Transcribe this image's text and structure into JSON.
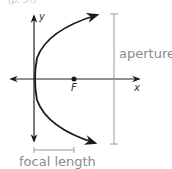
{
  "figure": {
    "top_fragment": "(p. 5?)",
    "axes": {
      "x_label": "x",
      "y_label": "y"
    },
    "focus_label": "F",
    "aperture_label": "aperture",
    "focal_length_label": "focal length",
    "colors": {
      "curve": "#1a1a1a",
      "axes": "#222222",
      "annotation": "#9a9a9a",
      "annotation_text": "#8a8a8a"
    }
  }
}
